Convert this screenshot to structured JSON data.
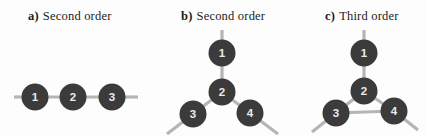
{
  "colors": {
    "background": "#fdfdfd",
    "node_fill": "#3b3b3b",
    "node_label": "#ebebeb",
    "edge": "#b5b5b5",
    "label_text": "#1c1c1c"
  },
  "figure": {
    "node_radius": 13.5,
    "edge_width": 3.2,
    "panels": [
      {
        "id": "a",
        "label_prefix": "a)",
        "label_text": "Second order",
        "graph": {
          "nodes": [
            {
              "id": "1",
              "x": 35,
              "y": 97
            },
            {
              "id": "2",
              "x": 73,
              "y": 97
            },
            {
              "id": "3",
              "x": 112,
              "y": 97
            }
          ],
          "edges": [
            {
              "from": "1",
              "to": "2"
            },
            {
              "from": "2",
              "to": "3"
            }
          ],
          "stubs": [
            {
              "node": "1",
              "x": 14,
              "y": 97
            },
            {
              "node": "3",
              "x": 138,
              "y": 97
            }
          ]
        }
      },
      {
        "id": "b",
        "label_prefix": "b)",
        "label_text": "Second order",
        "graph": {
          "nodes": [
            {
              "id": "1",
              "x": 222,
              "y": 53
            },
            {
              "id": "2",
              "x": 222,
              "y": 92
            },
            {
              "id": "3",
              "x": 193,
              "y": 114
            },
            {
              "id": "4",
              "x": 250,
              "y": 113
            }
          ],
          "edges": [
            {
              "from": "1",
              "to": "2"
            },
            {
              "from": "2",
              "to": "3"
            },
            {
              "from": "2",
              "to": "4"
            }
          ],
          "stubs": [
            {
              "node": "1",
              "x": 222,
              "y": 30
            },
            {
              "node": "3",
              "x": 167,
              "y": 134
            },
            {
              "node": "4",
              "x": 278,
              "y": 134
            }
          ]
        }
      },
      {
        "id": "c",
        "label_prefix": "c)",
        "label_text": "Third order",
        "graph": {
          "nodes": [
            {
              "id": "1",
              "x": 364,
              "y": 53
            },
            {
              "id": "2",
              "x": 364,
              "y": 91
            },
            {
              "id": "3",
              "x": 336,
              "y": 113
            },
            {
              "id": "4",
              "x": 394,
              "y": 111
            }
          ],
          "edges": [
            {
              "from": "1",
              "to": "2"
            },
            {
              "from": "2",
              "to": "3"
            },
            {
              "from": "2",
              "to": "4"
            },
            {
              "from": "3",
              "to": "4"
            }
          ],
          "stubs": [
            {
              "node": "1",
              "x": 364,
              "y": 30
            },
            {
              "node": "3",
              "x": 312,
              "y": 132
            },
            {
              "node": "4",
              "x": 418,
              "y": 130
            }
          ]
        }
      }
    ]
  }
}
